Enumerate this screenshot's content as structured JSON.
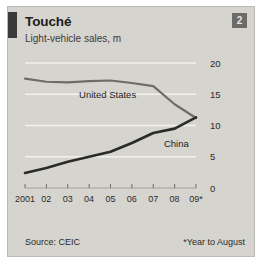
{
  "card": {
    "badge_number": "2",
    "title": "Touché",
    "subtitle": "Light-vehicle sales, m",
    "source": "Source: CEIC",
    "footnote": "*Year to August",
    "background_color": "#d6d4cf",
    "rule_color": "#3a3a3a",
    "badge_color": "#6d6b67"
  },
  "chart_data": {
    "type": "line",
    "title": "Touché",
    "subtitle": "Light-vehicle sales, m",
    "xlabel": "",
    "ylabel": "Light-vehicle sales, m",
    "x": [
      "2001",
      "02",
      "03",
      "04",
      "05",
      "06",
      "07",
      "08",
      "09*"
    ],
    "xtick_labels": [
      "2001",
      "02",
      "03",
      "04",
      "05",
      "06",
      "07",
      "08",
      "09*"
    ],
    "ytick_labels": [
      "0",
      "5",
      "10",
      "15",
      "20"
    ],
    "ytick_values": [
      0,
      5,
      10,
      15,
      20
    ],
    "ylim": [
      0,
      20
    ],
    "xlim": [
      "2001",
      "09*"
    ],
    "grid": true,
    "grid_color": "#f2f1ee",
    "y_axis_position": "right",
    "legend": "inline-labels",
    "series": [
      {
        "name": "United States",
        "color": "#6e6c68",
        "values": [
          17.5,
          17.0,
          16.9,
          17.1,
          17.2,
          16.8,
          16.3,
          13.4,
          11.2
        ]
      },
      {
        "name": "China",
        "color": "#2a2a28",
        "values": [
          2.4,
          3.2,
          4.2,
          5.0,
          5.8,
          7.2,
          8.8,
          9.5,
          11.3
        ]
      }
    ],
    "annotations": [
      {
        "text": "United States",
        "series": "United States"
      },
      {
        "text": "China",
        "series": "China"
      }
    ],
    "source": "Source: CEIC",
    "footnote": "*Year to August"
  }
}
